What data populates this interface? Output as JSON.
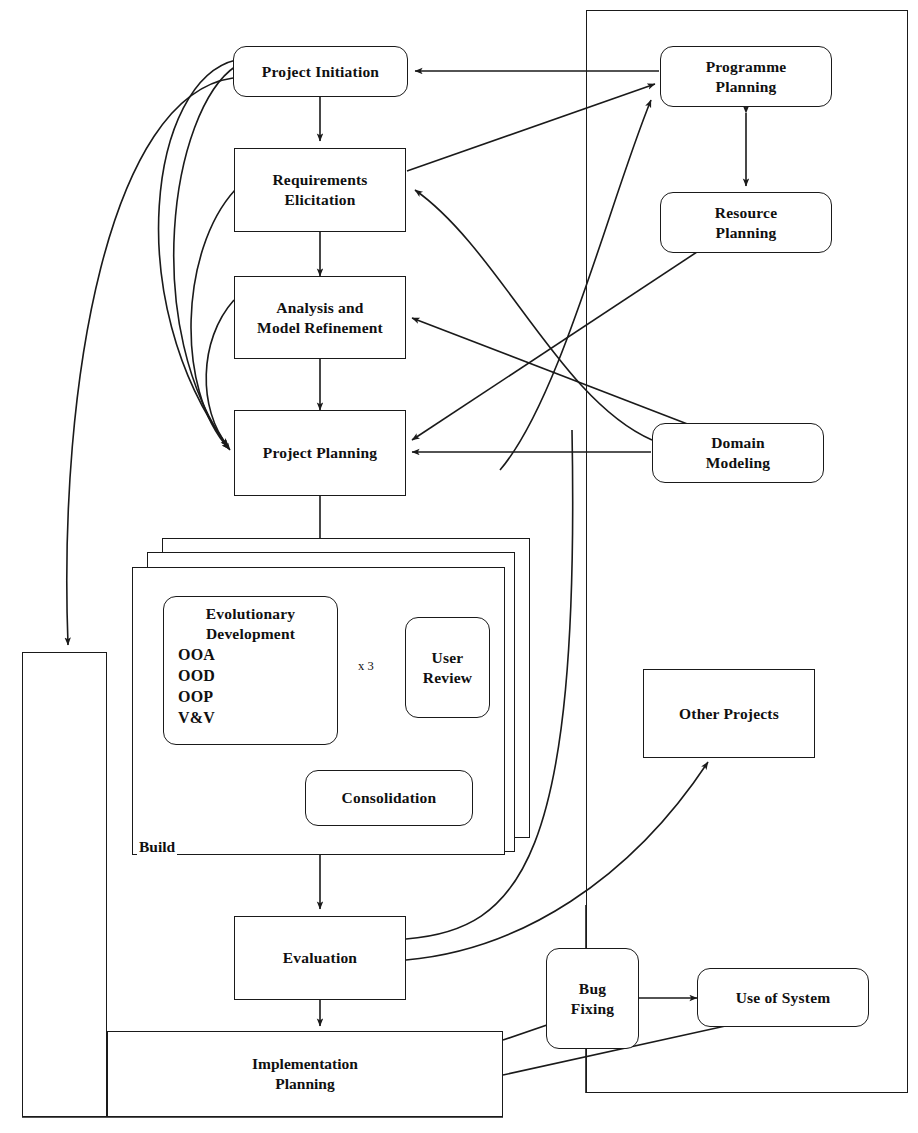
{
  "diagram": {
    "type": "flowchart",
    "style": {
      "line_color": "#1a1a1a",
      "background": "#ffffff",
      "text_color": "#101010"
    },
    "containers": [
      {
        "id": "left-frame",
        "name": "left-outer-frame",
        "label": ""
      },
      {
        "id": "right-frame",
        "name": "right-outer-frame",
        "label": ""
      },
      {
        "id": "build-stack",
        "name": "build-stack-container",
        "label": "Build"
      }
    ],
    "nodes": [
      {
        "id": "project-initiation",
        "label": "Project Initiation",
        "lines": [
          "Project Initiation"
        ],
        "shape": "rounded"
      },
      {
        "id": "requirements",
        "label": "Requirements Elicitation",
        "lines": [
          "Requirements",
          "Elicitation"
        ],
        "shape": "rect"
      },
      {
        "id": "analysis",
        "label": "Analysis and Model Refinement",
        "lines": [
          "Analysis and",
          "Model Refinement"
        ],
        "shape": "rect"
      },
      {
        "id": "project-planning",
        "label": "Project Planning",
        "lines": [
          "Project Planning"
        ],
        "shape": "rect"
      },
      {
        "id": "programme-planning",
        "label": "Programme Planning",
        "lines": [
          "Programme",
          "Planning"
        ],
        "shape": "rounded"
      },
      {
        "id": "resource-planning",
        "label": "Resource Planning",
        "lines": [
          "Resource",
          "Planning"
        ],
        "shape": "rounded"
      },
      {
        "id": "domain-modeling",
        "label": "Domain Modeling",
        "lines": [
          "Domain",
          "Modeling"
        ],
        "shape": "rounded"
      },
      {
        "id": "other-projects",
        "label": "Other Projects",
        "lines": [
          "Other Projects"
        ],
        "shape": "rect"
      },
      {
        "id": "evolutionary-development",
        "label": "Evolutionary Development",
        "lines": [
          "Evolutionary",
          "Development"
        ],
        "items": [
          "OOA",
          "OOD",
          "OOP",
          "V&V"
        ],
        "shape": "rounded"
      },
      {
        "id": "user-review",
        "label": "User Review",
        "lines": [
          "User",
          "Review"
        ],
        "shape": "rounded"
      },
      {
        "id": "consolidation",
        "label": "Consolidation",
        "lines": [
          "Consolidation"
        ],
        "shape": "rounded"
      },
      {
        "id": "evaluation",
        "label": "Evaluation",
        "lines": [
          "Evaluation"
        ],
        "shape": "rect"
      },
      {
        "id": "implementation-planning",
        "label": "Implementation Planning",
        "lines": [
          "Implementation",
          "Planning"
        ],
        "shape": "rect"
      },
      {
        "id": "bug-fixing",
        "label": "Bug Fixing",
        "lines": [
          "Bug",
          "Fixing"
        ],
        "shape": "rounded"
      },
      {
        "id": "use-of-system",
        "label": "Use of System",
        "lines": [
          "Use of System"
        ],
        "shape": "rounded"
      }
    ],
    "edge_labels": [
      {
        "id": "iteration-count",
        "text": "x 3",
        "between": [
          "evolutionary-development",
          "user-review"
        ]
      }
    ],
    "edges": [
      {
        "from": "project-initiation",
        "to": "requirements",
        "arrow": "single"
      },
      {
        "from": "requirements",
        "to": "analysis",
        "arrow": "single"
      },
      {
        "from": "analysis",
        "to": "project-planning",
        "arrow": "single"
      },
      {
        "from": "project-planning",
        "to": "build-stack",
        "arrow": "single"
      },
      {
        "from": "build-stack",
        "to": "evaluation",
        "arrow": "single"
      },
      {
        "from": "evaluation",
        "to": "implementation-planning",
        "arrow": "single"
      },
      {
        "from": "programme-planning",
        "to": "project-initiation",
        "arrow": "single"
      },
      {
        "from": "programme-planning",
        "to": "resource-planning",
        "arrow": "double"
      },
      {
        "from": "requirements",
        "to": "programme-planning",
        "arrow": "single"
      },
      {
        "from": "project-initiation",
        "to": "programme-planning",
        "arrow": "single"
      },
      {
        "from": "domain-modeling",
        "to": "requirements",
        "arrow": "single"
      },
      {
        "from": "domain-modeling",
        "to": "analysis",
        "arrow": "single"
      },
      {
        "from": "domain-modeling",
        "to": "project-planning",
        "arrow": "double"
      },
      {
        "from": "project-initiation",
        "to": "project-planning",
        "arrow": "single"
      },
      {
        "from": "requirements",
        "to": "project-planning",
        "arrow": "single"
      },
      {
        "from": "analysis",
        "to": "project-planning",
        "arrow": "single"
      },
      {
        "from": "evolutionary-development",
        "to": "user-review",
        "arrow": "double",
        "label": "x 3"
      },
      {
        "from": "user-review",
        "to": "consolidation",
        "arrow": "single"
      },
      {
        "from": "evaluation",
        "to": "other-projects",
        "arrow": "single"
      },
      {
        "from": "evaluation",
        "to": "requirements",
        "arrow": "single"
      },
      {
        "from": "implementation-planning",
        "to": "bug-fixing",
        "arrow": "single"
      },
      {
        "from": "implementation-planning",
        "to": "use-of-system",
        "arrow": "single"
      },
      {
        "from": "bug-fixing",
        "to": "use-of-system",
        "arrow": "double"
      },
      {
        "from": "implementation-planning",
        "to": "left-frame",
        "arrow": "single"
      },
      {
        "from": "left-frame",
        "to": "project-initiation",
        "arrow": "single"
      }
    ]
  }
}
